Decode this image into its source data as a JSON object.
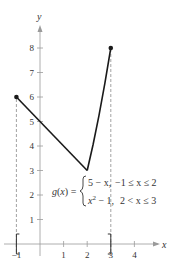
{
  "chart_data": {
    "type": "line",
    "title": "",
    "xlabel": "x",
    "ylabel": "y",
    "xlim": [
      -1.3,
      4.6
    ],
    "ylim": [
      0,
      8.6
    ],
    "x_ticks": [
      -1,
      1,
      2,
      3,
      4
    ],
    "x_tick_labels": [
      "−1",
      "1",
      "2",
      "3",
      "4"
    ],
    "y_ticks": [
      1,
      2,
      3,
      4,
      5,
      6,
      7,
      8
    ],
    "y_tick_labels": [
      "1",
      "2",
      "3",
      "4",
      "5",
      "6",
      "7",
      "8"
    ],
    "grid": false,
    "series": [
      {
        "name": "5 − x, −1 ≤ x ≤ 2",
        "points": [
          [
            -1,
            6
          ],
          [
            2,
            3
          ]
        ]
      },
      {
        "name": "x² − 1, 2 < x ≤ 3",
        "points": [
          [
            2,
            3
          ],
          [
            2.25,
            4.0625
          ],
          [
            2.5,
            5.25
          ],
          [
            2.75,
            6.5625
          ],
          [
            3,
            8
          ]
        ]
      }
    ],
    "endpoints": [
      {
        "x": -1,
        "y": 6,
        "style": "closed"
      },
      {
        "x": 3,
        "y": 8,
        "style": "closed"
      }
    ],
    "dashed_guides": [
      {
        "x": -1,
        "from_y": 0,
        "to_y": 6
      },
      {
        "x": 3,
        "from_y": 0,
        "to_y": 8
      }
    ],
    "interval_brackets": {
      "left": -1,
      "right": 3
    },
    "annotation": {
      "lhs": "g(x) =",
      "case1_expr": "5 − x,",
      "case1_cond": "−1 ≤ x ≤ 2",
      "case2_expr": "x² − 1,",
      "case2_cond": "2 < x ≤ 3"
    },
    "colors": {
      "axis": "#9a9a9a",
      "curve": "#1a1a1a",
      "guide": "#8a8a8a",
      "text": "#333333"
    }
  }
}
